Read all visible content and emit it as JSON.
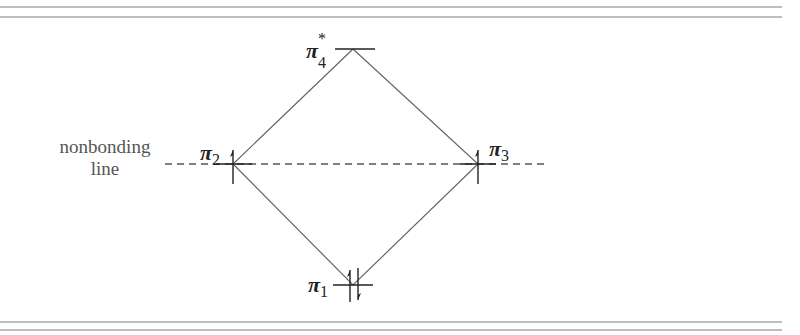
{
  "figure": {
    "type": "molecular-orbital-energy-diagram",
    "reference_line_label": [
      "nonbonding",
      "line"
    ],
    "orbitals": [
      {
        "id": "pi4",
        "symbol": "π",
        "subscript": "4",
        "superscript": "*",
        "electrons": 0,
        "position": "top",
        "character": "antibonding"
      },
      {
        "id": "pi2",
        "symbol": "π",
        "subscript": "2",
        "superscript": "",
        "electrons": 1,
        "position": "left-middle",
        "character": "nonbonding"
      },
      {
        "id": "pi3",
        "symbol": "π",
        "subscript": "3",
        "superscript": "",
        "electrons": 1,
        "position": "right-middle",
        "character": "nonbonding"
      },
      {
        "id": "pi1",
        "symbol": "π",
        "subscript": "1",
        "superscript": "",
        "electrons": 2,
        "position": "bottom",
        "character": "bonding"
      }
    ],
    "colors": {
      "lines": "#555555",
      "levels": "#222222",
      "rules": "#bdbdbd",
      "text": "#333333"
    }
  }
}
